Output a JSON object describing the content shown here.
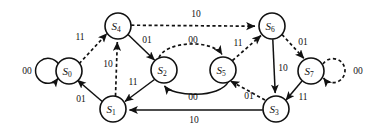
{
  "diagram": {
    "kind": "finite-state-machine",
    "title": "",
    "canvas": {
      "width": 383,
      "height": 133,
      "background": "#ffffff"
    },
    "legend": {
      "solid_meaning": "solid transition",
      "dashed_meaning": "dashed transition"
    },
    "states": [
      {
        "id": "S0",
        "label": "S",
        "sub": "0",
        "cx": 69,
        "cy": 71,
        "r": 13
      },
      {
        "id": "S1",
        "label": "S",
        "sub": "1",
        "cx": 113,
        "cy": 109,
        "r": 13
      },
      {
        "id": "S2",
        "label": "S",
        "sub": "2",
        "cx": 164,
        "cy": 70,
        "r": 13
      },
      {
        "id": "S3",
        "label": "S",
        "sub": "3",
        "cx": 276,
        "cy": 109,
        "r": 13
      },
      {
        "id": "S4",
        "label": "S",
        "sub": "4",
        "cx": 118,
        "cy": 26,
        "r": 13
      },
      {
        "id": "S5",
        "label": "S",
        "sub": "5",
        "cx": 223,
        "cy": 70,
        "r": 13
      },
      {
        "id": "S6",
        "label": "S",
        "sub": "6",
        "cx": 272,
        "cy": 26,
        "r": 13
      },
      {
        "id": "S7",
        "label": "S",
        "sub": "7",
        "cx": 311,
        "cy": 71,
        "r": 13
      }
    ],
    "transitions": [
      {
        "id": "t-s0-s0",
        "from": "S0",
        "to": "S0",
        "input": "00",
        "style": "solid",
        "shape": "self-loop-left",
        "label_x": 27,
        "label_y": 71
      },
      {
        "id": "t-s0-s4",
        "from": "S0",
        "to": "S4",
        "input": "11",
        "style": "dashed",
        "shape": "line",
        "label_x": 80,
        "label_y": 37
      },
      {
        "id": "t-s1-s0",
        "from": "S1",
        "to": "S0",
        "input": "01",
        "style": "solid",
        "shape": "line",
        "label_x": 81,
        "label_y": 99
      },
      {
        "id": "t-s1-s4",
        "from": "S1",
        "to": "S4",
        "input": "10",
        "style": "dashed",
        "shape": "line",
        "label_x": 108,
        "label_y": 64
      },
      {
        "id": "t-s4-s2",
        "from": "S4",
        "to": "S2",
        "input": "01",
        "style": "solid",
        "shape": "line",
        "label_x": 147,
        "label_y": 40
      },
      {
        "id": "t-s4-s6",
        "from": "S4",
        "to": "S6",
        "input": "10",
        "style": "dashed",
        "shape": "line",
        "label_x": 196,
        "label_y": 14
      },
      {
        "id": "t-s2-s1",
        "from": "S2",
        "to": "S1",
        "input": "11",
        "style": "solid",
        "shape": "line",
        "label_x": 133,
        "label_y": 82
      },
      {
        "id": "t-s2-s5",
        "from": "S2",
        "to": "S5",
        "input": "00",
        "style": "dashed",
        "shape": "arc-up",
        "label_x": 193,
        "label_y": 40
      },
      {
        "id": "t-s5-s2",
        "from": "S5",
        "to": "S2",
        "input": "00",
        "style": "solid",
        "shape": "arc-down",
        "label_x": 193,
        "label_y": 97
      },
      {
        "id": "t-s5-s6",
        "from": "S5",
        "to": "S6",
        "input": "11",
        "style": "dashed",
        "shape": "line",
        "label_x": 238,
        "label_y": 43
      },
      {
        "id": "t-s6-s3",
        "from": "S6",
        "to": "S3",
        "input": "10",
        "style": "solid",
        "shape": "line",
        "label_x": 283,
        "label_y": 68
      },
      {
        "id": "t-s6-s7",
        "from": "S6",
        "to": "S7",
        "input": "01",
        "style": "dashed",
        "shape": "line",
        "label_x": 303,
        "label_y": 42
      },
      {
        "id": "t-s7-s7",
        "from": "S7",
        "to": "S7",
        "input": "00",
        "style": "dashed",
        "shape": "self-loop-right",
        "label_x": 358,
        "label_y": 71
      },
      {
        "id": "t-s7-s3",
        "from": "S7",
        "to": "S3",
        "input": "11",
        "style": "solid",
        "shape": "line",
        "label_x": 303,
        "label_y": 97
      },
      {
        "id": "t-s3-s5",
        "from": "S3",
        "to": "S5",
        "input": "01",
        "style": "dashed",
        "shape": "line",
        "label_x": 249,
        "label_y": 96
      },
      {
        "id": "t-s3-s1",
        "from": "S3",
        "to": "S1",
        "input": "10",
        "style": "solid",
        "shape": "line",
        "label_x": 194,
        "label_y": 120
      }
    ]
  }
}
